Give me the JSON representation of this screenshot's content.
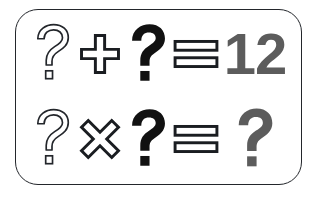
{
  "card": {
    "title": "Math Puzzle Card",
    "border_color": "#23262b",
    "background_color": "#ffffff"
  },
  "colors": {
    "outline_stroke": "#23262b",
    "outline_fill": "#ffffff",
    "solid_black": "#111111",
    "result_gray": "#5c5c5c"
  },
  "rows": [
    {
      "id": "equation-row-1",
      "operand_a": {
        "icon": "question-mark-outline-icon",
        "text": "?",
        "style": "outline"
      },
      "operator": {
        "icon": "plus-outline-icon",
        "text": "+",
        "style": "outline"
      },
      "operand_b": {
        "icon": "question-mark-solid-icon",
        "text": "?",
        "style": "solid-black"
      },
      "equals": {
        "icon": "equals-outline-icon",
        "text": "=",
        "style": "outline"
      },
      "result": {
        "icon": "number-12",
        "text": "12",
        "style": "solid-gray",
        "kind": "number"
      }
    },
    {
      "id": "equation-row-2",
      "operand_a": {
        "icon": "question-mark-outline-icon",
        "text": "?",
        "style": "outline"
      },
      "operator": {
        "icon": "multiply-outline-icon",
        "text": "×",
        "style": "outline"
      },
      "operand_b": {
        "icon": "question-mark-solid-icon",
        "text": "?",
        "style": "solid-black"
      },
      "equals": {
        "icon": "equals-outline-icon",
        "text": "=",
        "style": "outline"
      },
      "result": {
        "icon": "question-mark-gray-icon",
        "text": "?",
        "style": "solid-gray",
        "kind": "question"
      }
    }
  ]
}
